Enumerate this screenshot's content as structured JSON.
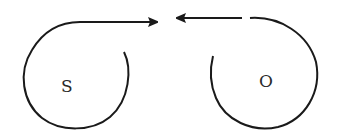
{
  "diagram": {
    "type": "two spiral arrows pointing toward each other",
    "nodes": [
      {
        "id": "S",
        "label": "S",
        "arrow_direction": "right"
      },
      {
        "id": "O",
        "label": "O",
        "arrow_direction": "left"
      }
    ],
    "colors": {
      "stroke": "#1a1a1a",
      "background": "#ffffff",
      "text": "#2a2a2a"
    }
  }
}
